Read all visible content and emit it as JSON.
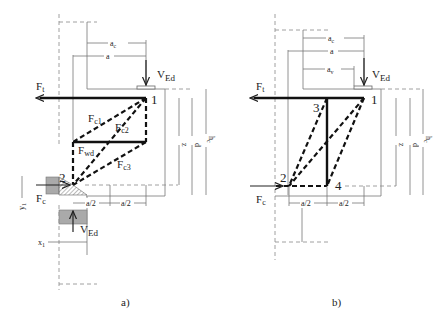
{
  "figure": {
    "panels": [
      {
        "id": "a",
        "caption": "a)",
        "forces": {
          "tension": "F",
          "tension_sub": "t",
          "compression": "F",
          "compression_sub": "c",
          "load": "V",
          "load_sub": "Ed",
          "load_bottom": "V",
          "load_bottom_sub": "Ed"
        },
        "members": [
          {
            "name": "F",
            "sub": "c1"
          },
          {
            "name": "F",
            "sub": "c2"
          },
          {
            "name": "F",
            "sub": "c3"
          },
          {
            "name": "F",
            "sub": "wd"
          }
        ],
        "nodes": [
          "1",
          "2"
        ],
        "dimensions": {
          "ac": "a",
          "ac_sub": "c",
          "a": "a",
          "z": "z",
          "d": "d",
          "hc": "h",
          "hc_sub": "c",
          "half1": "a/2",
          "half2": "a/2",
          "y": "y",
          "y_sub": "1",
          "x": "x",
          "x_sub": "1"
        }
      },
      {
        "id": "b",
        "caption": "b)",
        "forces": {
          "tension": "F",
          "tension_sub": "t",
          "compression": "F",
          "compression_sub": "c",
          "load": "V",
          "load_sub": "Ed"
        },
        "nodes": [
          "1",
          "2",
          "3",
          "4"
        ],
        "dimensions": {
          "ac": "a",
          "ac_sub": "c",
          "a": "a",
          "av": "a",
          "av_sub": "v",
          "z": "z",
          "d": "d",
          "hc": "h",
          "hc_sub": "c",
          "half1": "a/2",
          "half2": "a/2"
        }
      }
    ]
  }
}
